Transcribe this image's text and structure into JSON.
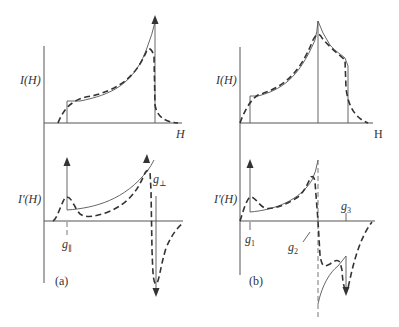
{
  "figure": {
    "panels": [
      {
        "id": "a",
        "caption": "(a)",
        "top_plot": {
          "ylabel": "I(H)",
          "xlabel": "H"
        },
        "bottom_plot": {
          "ylabel": "I′(H)",
          "markers": [
            "g∥",
            "g⊥"
          ]
        }
      },
      {
        "id": "b",
        "caption": "(b)",
        "top_plot": {
          "ylabel": "I(H)",
          "xlabel": "H"
        },
        "bottom_plot": {
          "ylabel": "I′(H)",
          "markers": [
            "g₁",
            "g₂",
            "g₃"
          ]
        }
      }
    ],
    "legend": {
      "solid_line": "ideal powder pattern (no linewidth)",
      "dashed_line": "broadened spectrum"
    }
  },
  "labels": {
    "a_I": "I(H)",
    "a_H": "H",
    "a_Ip": "I′(H)",
    "a_gpar": "g",
    "a_gpar_sub": "∥",
    "a_gperp": "g",
    "a_gperp_sub": "⊥",
    "a_caption": "(a)",
    "b_I": "I(H)",
    "b_H": "H",
    "b_Ip": "I′(H)",
    "b_g1": "g",
    "b_g1_sub": "1",
    "b_g2": "g",
    "b_g2_sub": "2",
    "b_g3": "g",
    "b_g3_sub": "3",
    "b_caption": "(b)"
  }
}
